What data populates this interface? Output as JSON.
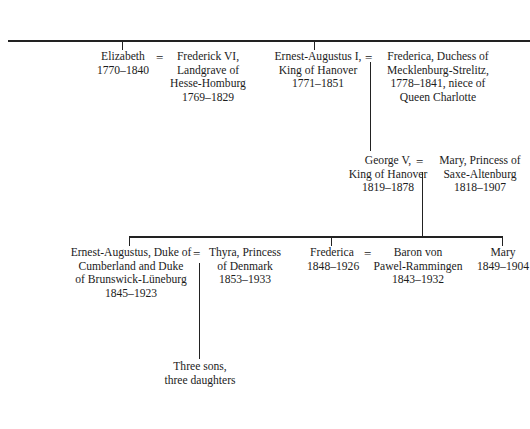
{
  "tree": {
    "generation1": {
      "elizabeth": {
        "lines": [
          "Elizabeth",
          "1770–1840"
        ]
      },
      "elizabeth_spouse": {
        "lines": [
          "Frederick VI,",
          "Landgrave of",
          "Hesse-Homburg",
          "1769–1829"
        ]
      },
      "ernest_augustus_i": {
        "lines": [
          "Ernest-Augustus I,",
          "King of Hanover",
          "1771–1851"
        ]
      },
      "ernest_augustus_i_spouse": {
        "lines": [
          "Frederica, Duchess of",
          "Mecklenburg-Strelitz,",
          "1778–1841, niece of",
          "Queen Charlotte"
        ]
      }
    },
    "generation2": {
      "george_v": {
        "lines": [
          "George V,",
          "King of Hanover",
          "1819–1878"
        ]
      },
      "george_v_spouse": {
        "lines": [
          "Mary, Princess of",
          "Saxe-Altenburg",
          "1818–1907"
        ]
      }
    },
    "generation3": {
      "ernest_augustus": {
        "lines": [
          "Ernest-Augustus, Duke of",
          "Cumberland and Duke",
          "of Brunswick-Lüneburg",
          "1845–1923"
        ]
      },
      "ernest_augustus_spouse": {
        "lines": [
          "Thyra, Princess",
          "of Denmark",
          "1853–1933"
        ]
      },
      "frederica": {
        "lines": [
          "Frederica",
          "1848–1926"
        ]
      },
      "frederica_spouse": {
        "lines": [
          "Baron von",
          "Pawel-Rammingen",
          "1843–1932"
        ]
      },
      "mary": {
        "lines": [
          "Mary",
          "1849–1904"
        ]
      }
    },
    "generation4": {
      "children": {
        "lines": [
          "Three sons,",
          "three daughters"
        ]
      }
    },
    "marriage_symbol": "="
  }
}
